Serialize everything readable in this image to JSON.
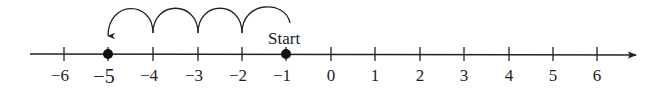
{
  "diagram": {
    "type": "number-line",
    "range": {
      "min": -6,
      "max": 6
    },
    "ticks": [
      {
        "value": -6,
        "label": "−6",
        "x": 64
      },
      {
        "value": -5,
        "label": "−5",
        "x": 108,
        "emphasized": true
      },
      {
        "value": -4,
        "label": "−4",
        "x": 153
      },
      {
        "value": -3,
        "label": "−3",
        "x": 198
      },
      {
        "value": -2,
        "label": "−2",
        "x": 242
      },
      {
        "value": -1,
        "label": "−1",
        "x": 286
      },
      {
        "value": 0,
        "label": "0",
        "x": 331
      },
      {
        "value": 1,
        "label": "1",
        "x": 375
      },
      {
        "value": 2,
        "label": "2",
        "x": 420
      },
      {
        "value": 3,
        "label": "3",
        "x": 464
      },
      {
        "value": 4,
        "label": "4",
        "x": 509
      },
      {
        "value": 5,
        "label": "5",
        "x": 553
      },
      {
        "value": 6,
        "label": "6",
        "x": 597
      }
    ],
    "points": [
      {
        "value": -1,
        "role": "start"
      },
      {
        "value": -5,
        "role": "end"
      }
    ],
    "start_label": "Start",
    "jumps": [
      {
        "from": -1,
        "to": -2
      },
      {
        "from": -2,
        "to": -3
      },
      {
        "from": -3,
        "to": -4
      },
      {
        "from": -4,
        "to": -5,
        "arrow": true
      }
    ],
    "direction": "left",
    "step_count": 4,
    "colors": {
      "line": "#222222",
      "point": "#111111"
    }
  }
}
